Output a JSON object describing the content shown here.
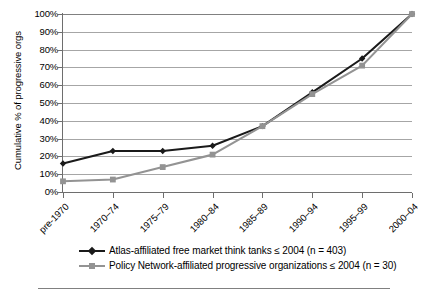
{
  "chart_data": {
    "type": "line",
    "title": "",
    "xlabel": "",
    "ylabel": "Cumulative % of progressive orgs",
    "categories": [
      "pre-1970",
      "1970–74",
      "1975–79",
      "1980–84",
      "1985–89",
      "1990–94",
      "1995–99",
      "2000–04"
    ],
    "ylim": [
      0,
      100
    ],
    "ytick_labels": [
      "100%",
      "90%",
      "80%",
      "70%",
      "60%",
      "50%",
      "40%",
      "30%",
      "20%",
      "10%",
      "0%"
    ],
    "ytick_values": [
      100,
      90,
      80,
      70,
      60,
      50,
      40,
      30,
      20,
      10,
      0
    ],
    "grid": true,
    "legend_position": "bottom",
    "series": [
      {
        "name": "Atlas-affiliated free market think tanks ≤ 2004 (n = 403)",
        "color": "#1a1a1a",
        "marker": "diamond",
        "values": [
          16,
          23,
          23,
          26,
          37,
          56,
          75,
          100
        ]
      },
      {
        "name": "Policy Network-affiliated progressive organizations ≤ 2004 (n = 30)",
        "color": "#939393",
        "marker": "square",
        "values": [
          6,
          7,
          14,
          21,
          37,
          55,
          71,
          100
        ]
      }
    ]
  },
  "axis": {
    "y_title": "Cumulative % of progressive orgs"
  },
  "legend": {
    "items": [
      {
        "label": "Atlas-affiliated free market think tanks ≤ 2004 (n = 403)",
        "color": "#1a1a1a",
        "marker": "diamond"
      },
      {
        "label": "Policy Network-affiliated progressive organizations ≤ 2004 (n = 30)",
        "color": "#939393",
        "marker": "square"
      }
    ]
  },
  "colors": {
    "series_black": "#1a1a1a",
    "series_gray": "#939393",
    "gridline": "#a6a6a6",
    "axis": "#6e6e6e",
    "background": "#ffffff"
  }
}
